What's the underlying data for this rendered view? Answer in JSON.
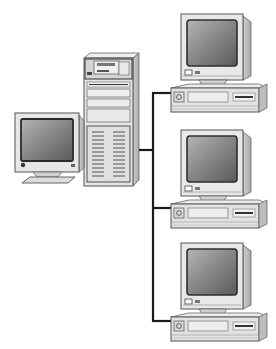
{
  "diagram": {
    "title": "Client-server network: one tower server connected to three workstations",
    "server": {
      "label": "Server tower with monitor",
      "kind": "server"
    },
    "bus": {
      "label": "Network cable"
    },
    "clients": [
      {
        "label": "Workstation 1",
        "kind": "desktop-pc"
      },
      {
        "label": "Workstation 2",
        "kind": "desktop-pc"
      },
      {
        "label": "Workstation 3",
        "kind": "desktop-pc"
      }
    ]
  },
  "colors": {
    "bg": "#ffffff",
    "case": "#e6e6e6",
    "case_shadow": "#b8b8b8",
    "outline": "#555555",
    "screen": "#7a7a7a",
    "screen_dark": "#3a3a3a",
    "cable": "#1a1a1a"
  }
}
